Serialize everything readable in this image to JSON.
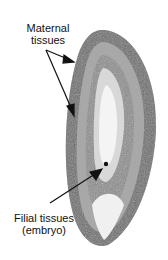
{
  "figure": {
    "labels": [
      {
        "id": "maternal",
        "lines": [
          "Maternal",
          "tissues"
        ]
      },
      {
        "id": "filial",
        "lines": [
          "Filial tissues",
          "(embryo)"
        ]
      }
    ]
  }
}
